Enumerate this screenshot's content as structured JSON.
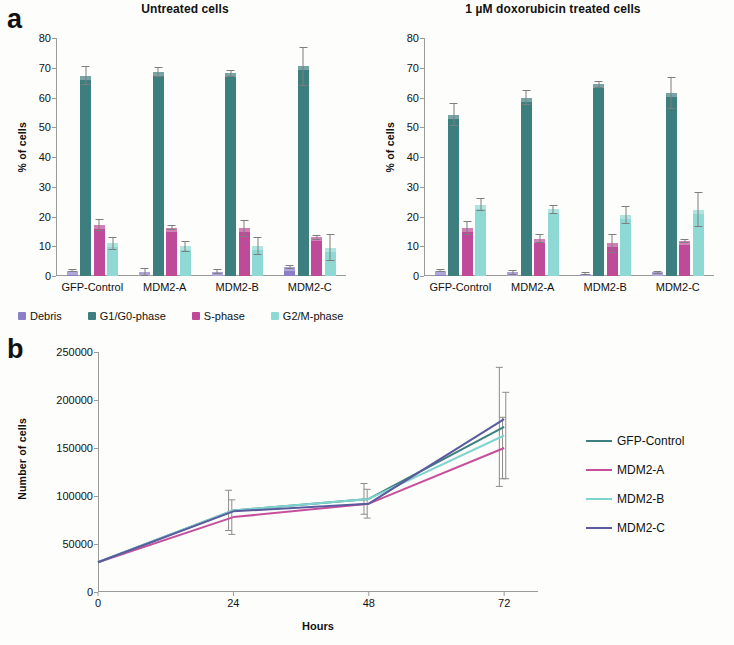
{
  "figure": {
    "panel_a_letter": "a",
    "panel_b_letter": "b"
  },
  "panel_a": {
    "left_chart": {
      "title": "Untreated cells",
      "ylabel": "% of cells"
    },
    "right_chart": {
      "title": "1 µM doxorubicin treated cells",
      "ylabel": "% of cells"
    },
    "legend": [
      {
        "label": "Debris",
        "color": "#8b7fc7"
      },
      {
        "label": "G1/G0-phase",
        "color": "#3d7e7e"
      },
      {
        "label": "S-phase",
        "color": "#c council"
      },
      {
        "label": "G2/M-phase",
        "color": "#8fd9d4"
      }
    ]
  },
  "chart_data": [
    {
      "type": "bar",
      "title": "Untreated cells",
      "xlabel": "",
      "ylabel": "% of cells",
      "ylim": [
        0,
        80
      ],
      "yticks": [
        0,
        10,
        20,
        30,
        40,
        50,
        60,
        70,
        80
      ],
      "categories": [
        "GFP-Control",
        "MDM2-A",
        "MDM2-B",
        "MDM2-C"
      ],
      "series": [
        {
          "name": "Debris",
          "color": "#8b7fc7",
          "values": [
            1.8,
            1.3,
            1.5,
            3.0
          ],
          "errors": [
            0.6,
            1.5,
            0.7,
            0.6
          ]
        },
        {
          "name": "G1/G0-phase",
          "color": "#3d7e7e",
          "values": [
            67.3,
            68.6,
            68.2,
            70.5
          ],
          "errors": [
            3.2,
            1.8,
            1.2,
            6.5
          ]
        },
        {
          "name": "S-phase",
          "color": "#bf4a9a",
          "values": [
            17.0,
            16.3,
            16.0,
            13.0
          ],
          "errors": [
            2.0,
            1.0,
            2.8,
            0.8
          ]
        },
        {
          "name": "G2/M-phase",
          "color": "#8fd9d4",
          "values": [
            11.0,
            10.0,
            10.0,
            9.5
          ],
          "errors": [
            2.2,
            1.8,
            3.0,
            4.5
          ]
        }
      ],
      "legend_position": "below"
    },
    {
      "type": "bar",
      "title": "1 µM doxorubicin treated cells",
      "xlabel": "",
      "ylabel": "% of cells",
      "ylim": [
        0,
        80
      ],
      "yticks": [
        0,
        10,
        20,
        30,
        40,
        50,
        60,
        70,
        80
      ],
      "categories": [
        "GFP-Control",
        "MDM2-A",
        "MDM2-B",
        "MDM2-C"
      ],
      "series": [
        {
          "name": "Debris",
          "color": "#8b7fc7",
          "values": [
            1.8,
            1.3,
            0.8,
            1.3
          ],
          "errors": [
            0.4,
            0.8,
            0.4,
            0.5
          ]
        },
        {
          "name": "G1/G0-phase",
          "color": "#3d7e7e",
          "values": [
            54.2,
            60.0,
            64.5,
            61.5
          ],
          "errors": [
            3.8,
            2.5,
            1.2,
            5.5
          ]
        },
        {
          "name": "S-phase",
          "color": "#bf4a9a",
          "values": [
            16.2,
            12.5,
            11.0,
            11.8
          ],
          "errors": [
            2.4,
            1.5,
            3.2,
            0.8
          ]
        },
        {
          "name": "G2/M-phase",
          "color": "#8fd9d4",
          "values": [
            24.0,
            22.5,
            20.5,
            22.3
          ],
          "errors": [
            2.2,
            1.5,
            3.0,
            6.0
          ]
        }
      ],
      "legend_position": "below"
    },
    {
      "type": "line",
      "title": "",
      "xlabel": "Hours",
      "ylabel": "Number of cells",
      "x": [
        0,
        24,
        48,
        72
      ],
      "xticks": [
        0,
        24,
        48,
        72
      ],
      "xlim": [
        0,
        78
      ],
      "ylim": [
        0,
        250000
      ],
      "yticks": [
        0,
        50000,
        100000,
        150000,
        200000,
        250000
      ],
      "ytick_labels": [
        "0",
        "50000",
        "100000",
        "150000",
        "200000",
        "250000"
      ],
      "grid": false,
      "legend_position": "right",
      "series": [
        {
          "name": "GFP-Control",
          "color": "#3d7e7e",
          "values": [
            31000,
            85000,
            97000,
            172000
          ],
          "errors": [
            0,
            21000,
            16000,
            62000
          ]
        },
        {
          "name": "MDM2-A",
          "color": "#c64f9c",
          "values": [
            31000,
            78000,
            92000,
            150000
          ],
          "errors": [
            0,
            18000,
            15000,
            32000
          ]
        },
        {
          "name": "MDM2-B",
          "color": "#7fd4d0",
          "values": [
            31000,
            85000,
            97000,
            163000
          ],
          "errors": [
            0,
            0,
            0,
            45000
          ]
        },
        {
          "name": "MDM2-C",
          "color": "#5a5a9e",
          "values": [
            31000,
            84000,
            92000,
            180000
          ],
          "errors": [
            0,
            0,
            0,
            0
          ]
        }
      ]
    }
  ],
  "panel_b": {
    "ylabel": "Number of cells",
    "xlabel": "Hours",
    "legend": [
      {
        "label": "GFP-Control",
        "color": "#3d7e7e"
      },
      {
        "label": "MDM2-A",
        "color": "#c64f9c"
      },
      {
        "label": "MDM2-B",
        "color": "#7fd4d0"
      },
      {
        "label": "MDM2-C",
        "color": "#5a5a9e"
      }
    ]
  }
}
